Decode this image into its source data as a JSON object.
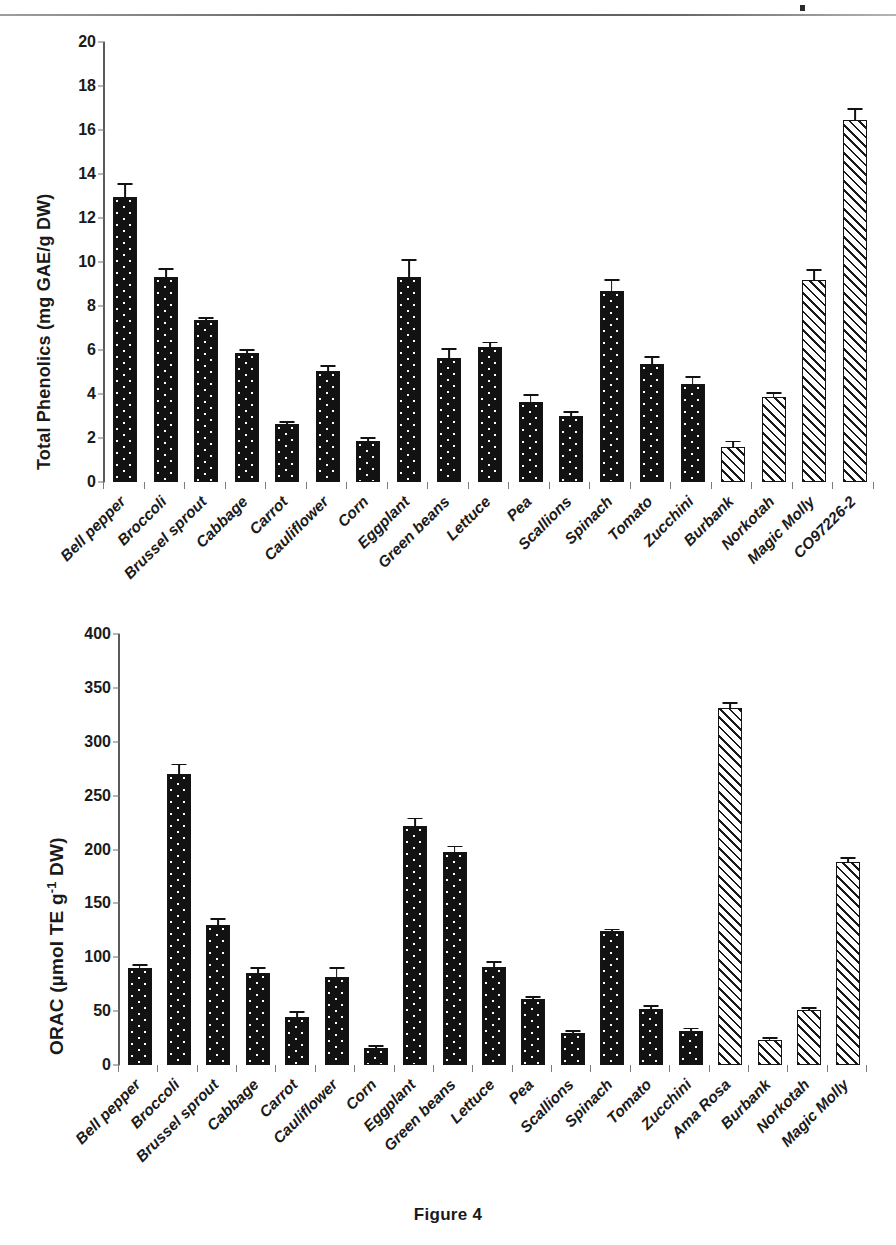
{
  "figure": {
    "caption": "Figure 4"
  },
  "chart_data": [
    {
      "type": "bar",
      "id": "total-phenolics",
      "title": "",
      "xlabel": "",
      "ylabel": "Total Phenolics (mg GAE/g DW)",
      "ylim": [
        0,
        20
      ],
      "yticks": [
        0,
        2,
        4,
        6,
        8,
        10,
        12,
        14,
        16,
        18,
        20
      ],
      "ytick_labels": [
        "0",
        "2",
        "4",
        "6",
        "8",
        "10",
        "12",
        "14",
        "16",
        "18",
        "20"
      ],
      "grid": false,
      "legend": "none",
      "categories": [
        "Bell pepper",
        "Broccoli",
        "Brussel sprout",
        "Cabbage",
        "Carrot",
        "Cauliflower",
        "Corn",
        "Eggplant",
        "Green beans",
        "Lettuce",
        "Pea",
        "Scallions",
        "Spinach",
        "Tomato",
        "Zucchini",
        "Burbank",
        "Norkotah",
        "Magic Molly",
        "CO97226-2"
      ],
      "values": [
        12.95,
        9.3,
        7.35,
        5.85,
        2.65,
        5.05,
        1.85,
        9.3,
        5.65,
        6.15,
        3.65,
        3.0,
        8.7,
        5.35,
        4.45,
        1.6,
        3.85,
        9.2,
        16.45
      ],
      "errors": [
        0.55,
        0.35,
        0.05,
        0.1,
        0.05,
        0.2,
        0.1,
        0.75,
        0.35,
        0.15,
        0.25,
        0.15,
        0.45,
        0.3,
        0.3,
        0.2,
        0.15,
        0.4,
        0.45
      ],
      "fills": [
        "dotted",
        "dotted",
        "dotted",
        "dotted",
        "dotted",
        "dotted",
        "dotted",
        "dotted",
        "dotted",
        "dotted",
        "dotted",
        "dotted",
        "dotted",
        "dotted",
        "dotted",
        "hatched",
        "hatched",
        "hatched",
        "hatched"
      ]
    },
    {
      "type": "bar",
      "id": "orac",
      "title": "",
      "xlabel": "",
      "ylabel": "ORAC (µmol TE g-1 DW)",
      "ylabel_base": "ORAC (µmol TE g",
      "ylabel_sup": "-1",
      "ylabel_tail": " DW)",
      "ylim": [
        0,
        400
      ],
      "yticks": [
        0,
        50,
        100,
        150,
        200,
        250,
        300,
        350,
        400
      ],
      "ytick_labels": [
        "0",
        "50",
        "100",
        "150",
        "200",
        "250",
        "300",
        "350",
        "400"
      ],
      "grid": false,
      "legend": "none",
      "categories": [
        "Bell pepper",
        "Broccoli",
        "Brussel sprout",
        "Cabbage",
        "Carrot",
        "Cauliflower",
        "Corn",
        "Eggplant",
        "Green beans",
        "Lettuce",
        "Pea",
        "Scallions",
        "Spinach",
        "Tomato",
        "Zucchini",
        "Ama Rosa",
        "Burbank",
        "Norkotah",
        "Magic Molly"
      ],
      "values": [
        90,
        270,
        130,
        85,
        45,
        82,
        16,
        222,
        198,
        91,
        61,
        30,
        124,
        52,
        32,
        331,
        23,
        51,
        188
      ],
      "errors": [
        2,
        8,
        5,
        4,
        3,
        7,
        1,
        6,
        4,
        4,
        1,
        1,
        1,
        2,
        1,
        4,
        1,
        1,
        3
      ],
      "fills": [
        "dotted",
        "dotted",
        "dotted",
        "dotted",
        "dotted",
        "dotted",
        "dotted",
        "dotted",
        "dotted",
        "dotted",
        "dotted",
        "dotted",
        "dotted",
        "dotted",
        "dotted",
        "hatched",
        "hatched",
        "hatched",
        "hatched"
      ]
    }
  ]
}
